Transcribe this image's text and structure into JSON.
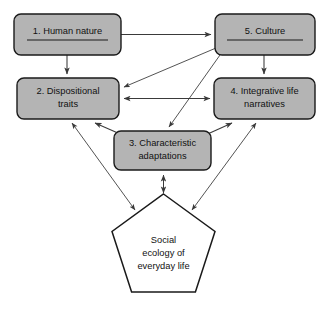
{
  "diagram": {
    "background_color": "#ffffff",
    "node_fill": "#b4b4b4",
    "node_stroke": "#1a1a1a",
    "pentagon_fill": "#ffffff",
    "edge_color": "#3a3a3a",
    "nodes": [
      {
        "id": "human-nature",
        "shape": "rounded-rect",
        "underline": true,
        "lines": [
          "1. Human nature"
        ],
        "x": 14,
        "y": 14,
        "w": 107,
        "h": 41
      },
      {
        "id": "culture",
        "shape": "rounded-rect",
        "underline": true,
        "lines": [
          "5. Culture"
        ],
        "x": 215,
        "y": 14,
        "w": 100,
        "h": 41
      },
      {
        "id": "dispositional-traits",
        "shape": "rounded-rect",
        "underline": false,
        "lines": [
          "2. Dispositional",
          "traits"
        ],
        "x": 17,
        "y": 78,
        "w": 102,
        "h": 41
      },
      {
        "id": "integrative-life-narratives",
        "shape": "rounded-rect",
        "underline": false,
        "lines": [
          "4. Integrative life",
          "narratives"
        ],
        "x": 214,
        "y": 78,
        "w": 101,
        "h": 41
      },
      {
        "id": "characteristic-adaptations",
        "shape": "rounded-rect",
        "underline": false,
        "lines": [
          "3. Characteristic",
          "adaptations"
        ],
        "x": 114,
        "y": 131,
        "w": 97,
        "h": 39
      },
      {
        "id": "social-ecology",
        "shape": "pentagon",
        "underline": false,
        "lines": [
          "Social",
          "ecology of",
          "everyday life"
        ],
        "x": 112,
        "y": 196,
        "w": 103,
        "h": 101
      }
    ],
    "edges": [
      {
        "id": "human-nature-to-culture",
        "from": "human-nature",
        "to": "culture",
        "arrows": "one-way"
      },
      {
        "id": "human-nature-to-dispositional-traits",
        "from": "human-nature",
        "to": "dispositional-traits",
        "arrows": "one-way"
      },
      {
        "id": "culture-to-integrative-life-narratives",
        "from": "culture",
        "to": "integrative-life-narratives",
        "arrows": "one-way"
      },
      {
        "id": "culture-to-dispositional-traits",
        "from": "culture",
        "to": "dispositional-traits",
        "arrows": "one-way"
      },
      {
        "id": "culture-to-characteristic-adaptations",
        "from": "culture",
        "to": "characteristic-adaptations",
        "arrows": "one-way"
      },
      {
        "id": "dispositional-traits-to-integrative-life-narratives",
        "from": "dispositional-traits",
        "to": "integrative-life-narratives",
        "arrows": "two-way"
      },
      {
        "id": "dispositional-traits-to-characteristic-adaptations",
        "from": "dispositional-traits",
        "to": "characteristic-adaptations",
        "arrows": "two-way"
      },
      {
        "id": "characteristic-adaptations-to-integrative-life-narratives",
        "from": "characteristic-adaptations",
        "to": "integrative-life-narratives",
        "arrows": "two-way"
      },
      {
        "id": "dispositional-traits-to-social-ecology",
        "from": "dispositional-traits",
        "to": "social-ecology",
        "arrows": "two-way"
      },
      {
        "id": "characteristic-adaptations-to-social-ecology",
        "from": "characteristic-adaptations",
        "to": "social-ecology",
        "arrows": "two-way"
      },
      {
        "id": "integrative-life-narratives-to-social-ecology",
        "from": "integrative-life-narratives",
        "to": "social-ecology",
        "arrows": "two-way"
      }
    ]
  }
}
